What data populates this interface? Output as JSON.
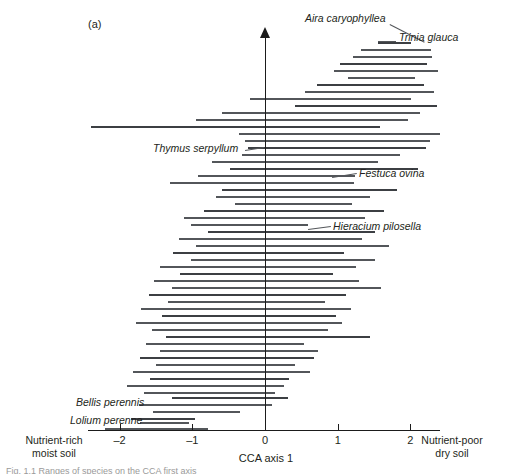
{
  "figure": {
    "panel_label": "(a)",
    "axis_title": "CCA axis 1",
    "left_end_caption": "Nutrient-rich\nmoist soil",
    "right_end_caption": "Nutrient-poor\ndry soil",
    "bottom_caption_fragment": "Fig. 1.1 Ranges of species on the CCA first axis"
  },
  "axis": {
    "ticks": [
      {
        "value": -2,
        "label": "–2"
      },
      {
        "value": -1,
        "label": "–1"
      },
      {
        "value": 0,
        "label": "0"
      },
      {
        "value": 1,
        "label": "1"
      },
      {
        "value": 2,
        "label": "2"
      }
    ],
    "xlim": [
      -2.43,
      2.41
    ],
    "px_per_unit": 72.7,
    "x_zero_px": 265
  },
  "labels": [
    {
      "name": "Aira caryophyllea",
      "text": "Aira caryophyllea",
      "x": 305,
      "y": 12,
      "leader": {
        "x1": 390,
        "y1": 24,
        "x2": 425,
        "y2": 42
      }
    },
    {
      "name": "Trinia glauca",
      "text": "Trinia glauca",
      "x": 399,
      "y": 31,
      "leader": {
        "x1": 378,
        "y1": 41,
        "x2": 396,
        "y2": 41
      }
    },
    {
      "name": "Thymus serpyllum",
      "text": "Thymus serpyllum",
      "x": 153,
      "y": 142,
      "leader": {
        "x1": 245,
        "y1": 150,
        "x2": 264,
        "y2": 147
      }
    },
    {
      "name": "Festuca ovina",
      "text": "Festuca ovina",
      "x": 359,
      "y": 167,
      "leader": {
        "x1": 332,
        "y1": 177,
        "x2": 357,
        "y2": 173
      }
    },
    {
      "name": "Hieracium pilosella",
      "text": "Hieracium pilosella",
      "x": 333,
      "y": 220,
      "leader": {
        "x1": 308,
        "y1": 229,
        "x2": 331,
        "y2": 226
      }
    },
    {
      "name": "Bellis perennis",
      "text": "Bellis perennis",
      "x": 76,
      "y": 396,
      "leader": {
        "x1": 151,
        "y1": 404,
        "x2": 170,
        "y2": 404
      }
    },
    {
      "name": "Lolium perenne",
      "text": "Lolium perenne",
      "x": 70,
      "y": 414,
      "leader": {
        "x1": 148,
        "y1": 422,
        "x2": 166,
        "y2": 422
      }
    }
  ],
  "chart_data": {
    "type": "bar",
    "orientation": "horizontal-range",
    "title": "",
    "xlabel": "CCA axis 1",
    "ylabel": "",
    "xlim": [
      -2.43,
      2.41
    ],
    "ylim": [
      0,
      60
    ],
    "grid": false,
    "legend": null,
    "annotations": [
      "Aira caryophyllea",
      "Trinia glauca",
      "Thymus serpyllum",
      "Festuca ovina",
      "Hieracium pilosella",
      "Bellis perennis",
      "Lolium perenne"
    ],
    "axis_end_labels": {
      "left": "Nutrient-rich moist soil",
      "right": "Nutrient-poor dry soil"
    },
    "bars": [
      {
        "row": 0,
        "y": 42,
        "start": 1.55,
        "end": 2.01
      },
      {
        "row": 1,
        "y": 49,
        "start": 1.32,
        "end": 2.28
      },
      {
        "row": 2,
        "y": 56,
        "start": 1.21,
        "end": 2.3
      },
      {
        "row": 3,
        "y": 63,
        "start": 1.03,
        "end": 2.23
      },
      {
        "row": 4,
        "y": 70,
        "start": 0.95,
        "end": 2.38
      },
      {
        "row": 5,
        "y": 77,
        "start": 1.14,
        "end": 2.06
      },
      {
        "row": 6,
        "y": 84,
        "start": 0.72,
        "end": 2.19
      },
      {
        "row": 7,
        "y": 91,
        "start": 0.55,
        "end": 2.32
      },
      {
        "row": 8,
        "y": 98,
        "start": -0.21,
        "end": 2.01
      },
      {
        "row": 9,
        "y": 105,
        "start": 0.41,
        "end": 2.36
      },
      {
        "row": 10,
        "y": 112,
        "start": -0.59,
        "end": 2.13
      },
      {
        "row": 11,
        "y": 119,
        "start": -0.95,
        "end": 1.97
      },
      {
        "row": 12,
        "y": 126,
        "start": -2.39,
        "end": 1.58
      },
      {
        "row": 13,
        "y": 133,
        "start": -0.36,
        "end": 2.41
      },
      {
        "row": 14,
        "y": 140,
        "start": -0.28,
        "end": 2.27
      },
      {
        "row": 15,
        "y": 147,
        "start": -0.23,
        "end": 2.21
      },
      {
        "row": 16,
        "y": 154,
        "start": -0.32,
        "end": 1.86
      },
      {
        "row": 17,
        "y": 161,
        "start": -0.73,
        "end": 1.56
      },
      {
        "row": 18,
        "y": 168,
        "start": -0.48,
        "end": 2.11
      },
      {
        "row": 19,
        "y": 175,
        "start": -0.92,
        "end": 1.24
      },
      {
        "row": 20,
        "y": 182,
        "start": -1.3,
        "end": 1.22
      },
      {
        "row": 21,
        "y": 189,
        "start": -0.59,
        "end": 1.81
      },
      {
        "row": 22,
        "y": 196,
        "start": -0.68,
        "end": 1.45
      },
      {
        "row": 23,
        "y": 203,
        "start": -0.41,
        "end": 1.2
      },
      {
        "row": 24,
        "y": 210,
        "start": -0.84,
        "end": 1.64
      },
      {
        "row": 25,
        "y": 217,
        "start": -1.11,
        "end": 1.37
      },
      {
        "row": 26,
        "y": 224,
        "start": -1.02,
        "end": 0.59
      },
      {
        "row": 27,
        "y": 231,
        "start": -0.78,
        "end": 1.52
      },
      {
        "row": 28,
        "y": 238,
        "start": -1.18,
        "end": 1.33
      },
      {
        "row": 29,
        "y": 245,
        "start": -0.95,
        "end": 1.7
      },
      {
        "row": 30,
        "y": 252,
        "start": -1.26,
        "end": 1.09
      },
      {
        "row": 31,
        "y": 259,
        "start": -1.02,
        "end": 1.51
      },
      {
        "row": 32,
        "y": 266,
        "start": -1.45,
        "end": 1.25
      },
      {
        "row": 33,
        "y": 273,
        "start": -1.17,
        "end": 0.94
      },
      {
        "row": 34,
        "y": 280,
        "start": -1.52,
        "end": 1.3
      },
      {
        "row": 35,
        "y": 287,
        "start": -1.28,
        "end": 1.6
      },
      {
        "row": 36,
        "y": 294,
        "start": -1.6,
        "end": 1.11
      },
      {
        "row": 37,
        "y": 301,
        "start": -1.34,
        "end": 0.82
      },
      {
        "row": 38,
        "y": 308,
        "start": -1.7,
        "end": 1.18
      },
      {
        "row": 39,
        "y": 315,
        "start": -1.42,
        "end": 0.98
      },
      {
        "row": 40,
        "y": 322,
        "start": -1.77,
        "end": 1.06
      },
      {
        "row": 41,
        "y": 329,
        "start": -1.55,
        "end": 0.86
      },
      {
        "row": 42,
        "y": 336,
        "start": -1.36,
        "end": 1.44
      },
      {
        "row": 43,
        "y": 343,
        "start": -1.64,
        "end": 0.53
      },
      {
        "row": 44,
        "y": 350,
        "start": -1.45,
        "end": 0.73
      },
      {
        "row": 45,
        "y": 357,
        "start": -1.72,
        "end": 0.68
      },
      {
        "row": 46,
        "y": 364,
        "start": -1.5,
        "end": 0.41
      },
      {
        "row": 47,
        "y": 371,
        "start": -1.82,
        "end": 0.62
      },
      {
        "row": 48,
        "y": 378,
        "start": -1.58,
        "end": 0.33
      },
      {
        "row": 49,
        "y": 385,
        "start": -1.9,
        "end": 0.26
      },
      {
        "row": 50,
        "y": 392,
        "start": -1.66,
        "end": 0.14
      },
      {
        "row": 51,
        "y": 397,
        "start": -1.28,
        "end": 0.31
      },
      {
        "row": 52,
        "y": 404,
        "start": -1.73,
        "end": 0.09
      },
      {
        "row": 53,
        "y": 411,
        "start": -1.54,
        "end": -0.35
      },
      {
        "row": 54,
        "y": 418,
        "start": -1.84,
        "end": -0.96
      },
      {
        "row": 55,
        "y": 422,
        "start": -1.72,
        "end": -1.04
      },
      {
        "row": 56,
        "y": 428,
        "start": -2.2,
        "end": -0.78
      }
    ]
  }
}
